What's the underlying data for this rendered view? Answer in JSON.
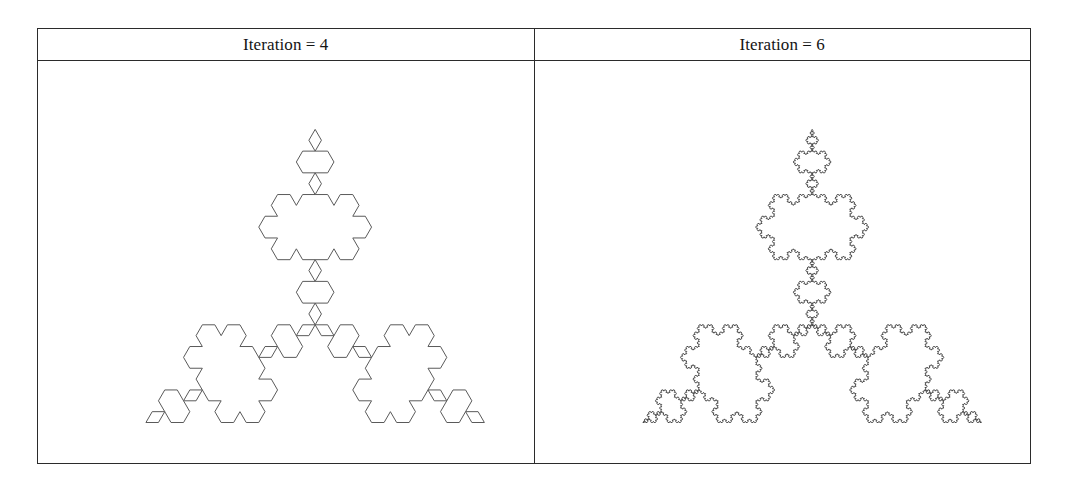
{
  "figure": {
    "background_color": "#ffffff",
    "border_color": "#2b2b2b",
    "stroke_color": "#5a5a5a",
    "columns": [
      {
        "header": "Iteration = 4",
        "cell_name": "koch-snowflake-iteration-4",
        "fractal": {
          "name": "koch-snowflake",
          "iterations": 4,
          "segments": 192,
          "center_x": 278,
          "center_y": 264,
          "radius": 196
        }
      },
      {
        "header": "Iteration = 6",
        "cell_name": "koch-snowflake-iteration-6",
        "fractal": {
          "name": "koch-snowflake",
          "iterations": 6,
          "segments": 1728,
          "center_x": 278,
          "center_y": 264,
          "radius": 196
        }
      }
    ]
  },
  "chart_data": {
    "type": "line",
    "xlabel": "",
    "ylabel": "",
    "panels": [
      {
        "label": "Iteration = 4",
        "shape": "koch-snowflake",
        "depth": 4,
        "base_sides": 3,
        "segment_count": 192,
        "stroke": "#5a5a5a"
      },
      {
        "label": "Iteration = 6",
        "shape": "koch-snowflake",
        "depth": 6,
        "base_sides": 3,
        "segment_count": 1728,
        "stroke": "#4a4a4a"
      }
    ]
  }
}
